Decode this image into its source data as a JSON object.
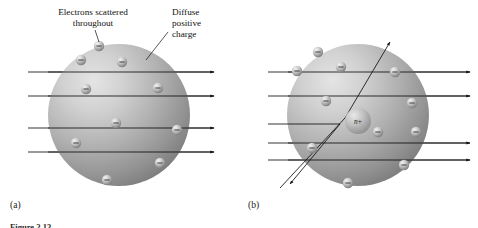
{
  "figure": {
    "panels": [
      {
        "id": "a",
        "label": "(a)",
        "model_name": "Thomson plum-pudding model",
        "annotations": [
          {
            "id": "electrons",
            "text_line_1": "Electrons scattered",
            "text_line_2": "throughout"
          },
          {
            "id": "positive",
            "text_line_1": "Diffuse",
            "text_line_2": "positive",
            "text_line_3": "charge"
          }
        ],
        "sphere": {
          "cx": 119,
          "cy": 115,
          "r": 71,
          "light_color": "#d8d8d8",
          "mid_color": "#a9a9a9",
          "dark_color": "#6f6f6f"
        },
        "electrons": [
          {
            "cx": 99,
            "cy": 46
          },
          {
            "cx": 81,
            "cy": 60
          },
          {
            "cx": 122,
            "cy": 62
          },
          {
            "cx": 86,
            "cy": 89
          },
          {
            "cx": 158,
            "cy": 88
          },
          {
            "cx": 116,
            "cy": 123
          },
          {
            "cx": 177,
            "cy": 130
          },
          {
            "cx": 76,
            "cy": 143
          },
          {
            "cx": 160,
            "cy": 163
          },
          {
            "cx": 107,
            "cy": 180
          }
        ],
        "rays": [
          {
            "id": "ray-1",
            "y": 72,
            "deflected": false
          },
          {
            "id": "ray-2",
            "y": 96,
            "deflected": false
          },
          {
            "id": "ray-3",
            "y": 128,
            "deflected": false
          },
          {
            "id": "ray-4",
            "y": 152,
            "deflected": false
          }
        ],
        "ray_count": 4,
        "ray_behavior": "All alpha particles pass straight through undeflected"
      },
      {
        "id": "b",
        "label": "(b)",
        "model_name": "Rutherford nuclear model",
        "annotations": [],
        "sphere": {
          "cx": 358,
          "cy": 115,
          "r": 71,
          "light_color": "#d8d8d8",
          "mid_color": "#a9a9a9",
          "dark_color": "#6f6f6f"
        },
        "nucleus": {
          "cx": 358,
          "cy": 121,
          "r": 13,
          "label": "n+",
          "label_italic_part": "n",
          "label_sign_part": "+"
        },
        "electrons": [
          {
            "cx": 318,
            "cy": 52
          },
          {
            "cx": 341,
            "cy": 67
          },
          {
            "cx": 297,
            "cy": 71
          },
          {
            "cx": 395,
            "cy": 72
          },
          {
            "cx": 326,
            "cy": 101
          },
          {
            "cx": 412,
            "cy": 103
          },
          {
            "cx": 378,
            "cy": 132
          },
          {
            "cx": 416,
            "cy": 132
          },
          {
            "cx": 312,
            "cy": 148
          },
          {
            "cx": 404,
            "cy": 165
          },
          {
            "cx": 348,
            "cy": 183
          }
        ],
        "rays": [
          {
            "id": "ray-1",
            "y": 72,
            "deflected": false
          },
          {
            "id": "ray-2",
            "y": 96,
            "deflected": false
          },
          {
            "id": "ray-3",
            "y": 110,
            "deflected": true,
            "type": "large-angle-deflection"
          },
          {
            "id": "ray-4",
            "y": 118,
            "deflected": true,
            "type": "backscatter"
          },
          {
            "id": "ray-5",
            "y": 143,
            "deflected": false
          },
          {
            "id": "ray-6",
            "y": 160,
            "deflected": false
          }
        ],
        "ray_count": 6,
        "ray_behavior": "Most pass through; one is deflected at a large angle and one backscatters off the nucleus"
      }
    ],
    "caption": {
      "text": "Figure 2.13",
      "visible": "partially cropped at bottom edge"
    }
  }
}
